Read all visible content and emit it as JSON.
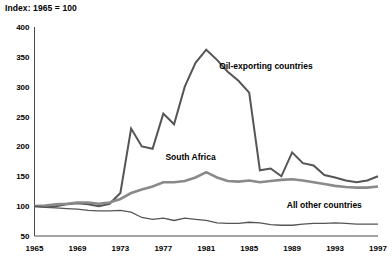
{
  "chart_data": {
    "type": "line",
    "title": "Index: 1965 = 100",
    "xlabel": "",
    "ylabel": "",
    "xlim": [
      1965,
      1997
    ],
    "ylim": [
      50,
      400
    ],
    "grid": false,
    "legend_position": "inline-annotations",
    "x_ticks": [
      "1965",
      "1969",
      "1973",
      "1977",
      "1981",
      "1985",
      "1989",
      "1993",
      "1997"
    ],
    "y_ticks": [
      "50",
      "100",
      "150",
      "200",
      "250",
      "300",
      "350",
      "400"
    ],
    "x": [
      1965,
      1966,
      1967,
      1968,
      1969,
      1970,
      1971,
      1972,
      1973,
      1974,
      1975,
      1976,
      1977,
      1978,
      1979,
      1980,
      1981,
      1982,
      1983,
      1984,
      1985,
      1986,
      1987,
      1988,
      1989,
      1990,
      1991,
      1992,
      1993,
      1994,
      1995,
      1996,
      1997
    ],
    "series": [
      {
        "name": "Oil-exporting countries",
        "color": "#555555",
        "width": 2.0,
        "label_x": 1982.2,
        "label_y": 330,
        "values": [
          100,
          99,
          100,
          103,
          105,
          103,
          100,
          104,
          122,
          230,
          200,
          196,
          255,
          237,
          300,
          340,
          362,
          345,
          325,
          310,
          290,
          160,
          163,
          150,
          190,
          172,
          168,
          152,
          148,
          143,
          140,
          143,
          150
        ]
      },
      {
        "name": "South Africa",
        "color": "#8a8a8a",
        "width": 2.6,
        "label_x": 1977.2,
        "label_y": 178,
        "values": [
          100,
          101,
          103,
          104,
          106,
          106,
          104,
          106,
          112,
          122,
          128,
          133,
          140,
          140,
          142,
          148,
          157,
          148,
          142,
          141,
          143,
          140,
          142,
          144,
          145,
          143,
          140,
          137,
          134,
          132,
          131,
          131,
          133
        ]
      },
      {
        "name": "All other countries",
        "color": "#555555",
        "width": 1.3,
        "label_x": 1988.5,
        "label_y": 97,
        "values": [
          100,
          98,
          97,
          96,
          95,
          93,
          92,
          92,
          93,
          90,
          81,
          78,
          80,
          76,
          80,
          78,
          76,
          72,
          71,
          71,
          73,
          72,
          69,
          68,
          68,
          70,
          71,
          71,
          72,
          71,
          70,
          70,
          70
        ]
      }
    ]
  },
  "axis": {
    "color": "#4a4a4a"
  }
}
